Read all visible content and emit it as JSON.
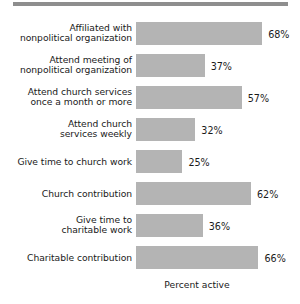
{
  "chart_data": {
    "type": "bar",
    "orientation": "horizontal",
    "title": "",
    "xlabel": "Percent active",
    "ylabel": "",
    "xlim": [
      0,
      100
    ],
    "grid": false,
    "legend": null,
    "value_suffix": "%",
    "bar_color": "#b4b4b4",
    "categories": [
      "Affiliated with\nnonpolitical organization",
      "Attend meeting of\nnonpolitical organization",
      "Attend church services\nonce a month or more",
      "Attend church\nservices weekly",
      "Give time to church work",
      "Church contribution",
      "Give time to\ncharitable work",
      "Charitable contribution"
    ],
    "values": [
      68,
      37,
      57,
      32,
      25,
      62,
      36,
      66
    ],
    "value_labels": [
      "68%",
      "37%",
      "57%",
      "32%",
      "25%",
      "62%",
      "36%",
      "66%"
    ]
  },
  "figure": {
    "axis_title": "Percent active",
    "top_rule_color": "#8e8e8e",
    "background": "#ffffff"
  }
}
